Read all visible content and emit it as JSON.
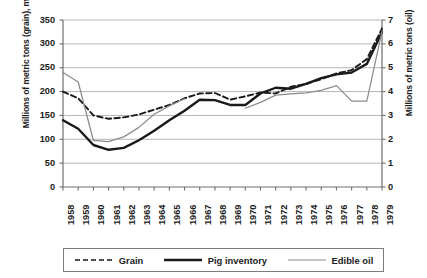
{
  "chart_data": {
    "type": "line",
    "title": "",
    "x": [
      1958,
      1959,
      1960,
      1961,
      1962,
      1963,
      1964,
      1965,
      1966,
      1967,
      1968,
      1969,
      1970,
      1971,
      1972,
      1973,
      1974,
      1975,
      1976,
      1977,
      1978,
      1979
    ],
    "xlabel": "",
    "ylabel": "Millions of metric tons (grain), millions (pigs)",
    "ylabel_right": "Millions of metric tons (oil)",
    "ylim": [
      0,
      350
    ],
    "yticks": [
      0,
      50,
      100,
      150,
      200,
      250,
      300,
      350
    ],
    "ylim_right": [
      0,
      7
    ],
    "yticks_right": [
      0,
      1,
      2,
      3,
      4,
      5,
      6,
      7
    ],
    "grid": true,
    "legend_position": "bottom",
    "series": [
      {
        "name": "Grain",
        "axis": "left",
        "style": "dashed",
        "color": "#1a1a1a",
        "values": [
          200,
          186,
          150,
          143,
          146,
          152,
          162,
          172,
          186,
          196,
          197,
          183,
          190,
          198,
          196,
          210,
          216,
          226,
          238,
          245,
          268,
          332
        ]
      },
      {
        "name": "Pig inventory",
        "axis": "left",
        "style": "solid-thick",
        "color": "#1a1a1a",
        "values": [
          140,
          122,
          88,
          78,
          82,
          98,
          118,
          140,
          160,
          183,
          182,
          172,
          172,
          196,
          208,
          206,
          216,
          228,
          236,
          240,
          258,
          325
        ]
      },
      {
        "name": "Edible oil",
        "axis": "right",
        "style": "solid-thin",
        "color": "#8c8c8c",
        "values": [
          4.8,
          4.4,
          1.95,
          1.9,
          2.1,
          2.5,
          3.05,
          3.4,
          3.7,
          null,
          null,
          null,
          3.3,
          3.55,
          3.85,
          3.9,
          3.95,
          4.05,
          4.25,
          3.6,
          3.6,
          6.52
        ]
      }
    ]
  },
  "axes": {
    "left": {
      "label": "Millions of metric tons (grain), millions (pigs)",
      "ticks": [
        "0",
        "50",
        "100",
        "150",
        "200",
        "250",
        "300",
        "350"
      ]
    },
    "right": {
      "label": "Millions of metric tons (oil)",
      "ticks": [
        "0",
        "1",
        "2",
        "3",
        "4",
        "5",
        "6",
        "7"
      ]
    },
    "bottom": {
      "ticks": [
        "1958",
        "1959",
        "1960",
        "1961",
        "1962",
        "1963",
        "1964",
        "1965",
        "1966",
        "1967",
        "1968",
        "1969",
        "1970",
        "1971",
        "1972",
        "1973",
        "1974",
        "1975",
        "1976",
        "1977",
        "1978",
        "1979"
      ]
    }
  },
  "legend": {
    "items": [
      {
        "label": "Grain",
        "style": "dashed"
      },
      {
        "label": "Pig inventory",
        "style": "solid-thick"
      },
      {
        "label": "Edible oil",
        "style": "solid-thin"
      }
    ]
  },
  "colors": {
    "grain": "#1a1a1a",
    "pig_inventory": "#1a1a1a",
    "edible_oil": "#8c8c8c",
    "grid": "#aeaeae",
    "axis": "#6f6f6f"
  }
}
